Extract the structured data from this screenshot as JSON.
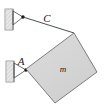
{
  "figure": {
    "kind": "statics-free-body-diagram",
    "width": 105,
    "height": 111,
    "background_color": "#ffffff"
  },
  "labels": {
    "cable_label": "C",
    "support_label": "A",
    "mass_label": "m"
  },
  "colors": {
    "block_fill": "#d5d5d5",
    "block_stroke": "#6f6f6f",
    "wall_fill": "#c9c9c9",
    "wall_stroke": "#8a8a8a",
    "hatch_stroke": "#a8a8a8",
    "cable_stroke": "#3a3a3a",
    "support_stroke": "#4a4a4a",
    "pin_dot": "#111111",
    "label_color": "#1a1a1a"
  },
  "geometry": {
    "block_points": "26,69 74,33 97,72 55,103",
    "cable_path": "23,17 74,33",
    "top_wall": {
      "x": 5,
      "y": 9,
      "w": 8,
      "h": 21
    },
    "bottom_wall": {
      "x": 6,
      "y": 61,
      "w": 8,
      "h": 21
    },
    "top_support_triangle": "13,11 13,25 23,17",
    "bottom_support_triangle": "14,63 14,78 26,70",
    "top_pin": {
      "cx": 23,
      "cy": 17,
      "r": 1.7
    },
    "bottom_pin": {
      "cx": 26,
      "cy": 70,
      "r": 1.7
    },
    "label_positions": {
      "cable_label": {
        "x": 47,
        "y": 22
      },
      "support_label": {
        "x": 21,
        "y": 65
      },
      "mass_label": {
        "x": 59,
        "y": 72
      }
    }
  }
}
